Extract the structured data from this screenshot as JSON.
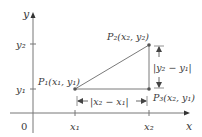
{
  "diagram": {
    "axes": {
      "x_label": "x",
      "y_label": "y",
      "origin_label": "0",
      "color": "#666666"
    },
    "ticks": {
      "x1": "x₁",
      "x2": "x₂",
      "y1": "y₁",
      "y2": "y₂"
    },
    "points": {
      "p1": "P₁(x₁, y₁)",
      "p2": "P₂(x₂, y₂)",
      "p3": "P₃(x₂, y₁)"
    },
    "distances": {
      "horizontal": "|x₂ − x₁|",
      "vertical": "|y₂ − y₁|"
    },
    "colors": {
      "triangle": "#7a7a7a",
      "point": "#555555",
      "text": "#3a3a3a"
    }
  }
}
